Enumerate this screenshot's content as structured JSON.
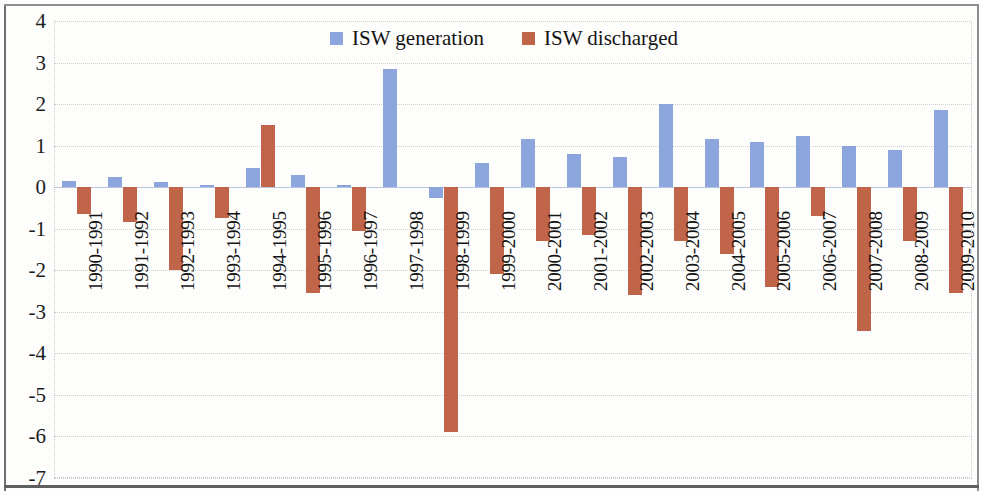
{
  "chart_data": {
    "type": "bar",
    "title": "",
    "subtitle": "",
    "xlabel": "",
    "ylabel": "",
    "ylim": [
      -7,
      4
    ],
    "ytick_step": 1,
    "yticks": [
      "4",
      "3",
      "2",
      "1",
      "0",
      "-1",
      "-2",
      "-3",
      "-4",
      "-5",
      "-6",
      "-7"
    ],
    "grid": true,
    "legend_position": "top-center",
    "categories": [
      "1990-1991",
      "1991-1992",
      "1992-1993",
      "1993-1994",
      "1994-1995",
      "1995-1996",
      "1996-1997",
      "1997-1998",
      "1998-1999",
      "1999-2000",
      "2000-2001",
      "2001-2002",
      "2002-2003",
      "2003-2004",
      "2004-2005",
      "2005-2006",
      "2006-2007",
      "2007-2008",
      "2008-2009",
      "2009-2010"
    ],
    "series": [
      {
        "name": "ISW generation",
        "color": "#8ca5dc",
        "values": [
          0.15,
          0.25,
          0.13,
          0.05,
          0.47,
          0.3,
          0.05,
          2.85,
          -0.25,
          0.58,
          1.15,
          0.8,
          0.72,
          2.0,
          1.17,
          1.08,
          1.23,
          1.0,
          0.9,
          1.85
        ]
      },
      {
        "name": "ISW discharged",
        "color": "#c0654a",
        "values": [
          -0.65,
          -0.85,
          -2.0,
          -0.75,
          1.5,
          -2.55,
          -1.05,
          0.0,
          -5.9,
          -2.1,
          -1.3,
          -1.15,
          -2.6,
          -1.3,
          -1.6,
          -2.4,
          -0.7,
          -3.45,
          -1.3,
          -2.55
        ]
      }
    ]
  },
  "legend": {
    "items": [
      {
        "label": "ISW generation",
        "color": "#8ca5dc",
        "swatch_name": "legend-swatch-generation"
      },
      {
        "label": "ISW discharged",
        "color": "#c0654a",
        "swatch_name": "legend-swatch-discharged"
      }
    ]
  }
}
